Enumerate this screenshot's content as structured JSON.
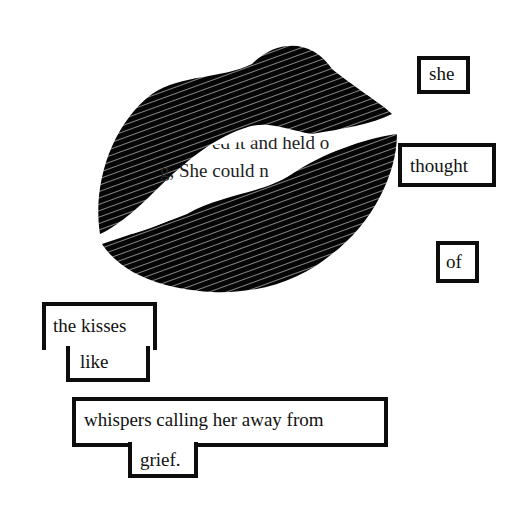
{
  "artwork": {
    "title": "blackout poem",
    "page_fragments": [
      "ed it and held o",
      "g, She could n",
      "g I  ' l"
    ],
    "words": {
      "w1": "she",
      "w2": "thought",
      "w3": "of",
      "w4a": "the kisses",
      "w4b": "like",
      "w5a": "whispers calling her away from",
      "w5b": "grief."
    }
  }
}
